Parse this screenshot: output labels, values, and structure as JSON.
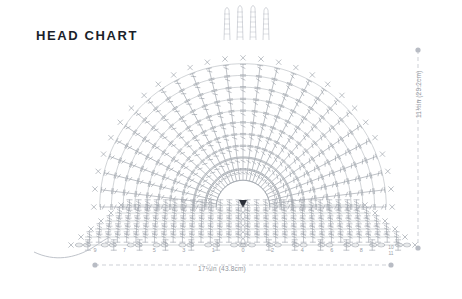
{
  "page": {
    "title": "HEAD CHART",
    "background_color": "#ffffff",
    "title_color": "#1b1f2a"
  },
  "dimensions": {
    "width_label": "17¼in (43.8cm)",
    "height_label": "11½in (29.2cm)",
    "guide_color": "#b8bcc4"
  },
  "chart": {
    "type": "crochet-stitch-diagram",
    "shape": "semicircular-fan",
    "stitch_color": "#9aa0a8",
    "center": {
      "x": 243,
      "y": 207
    },
    "radius": 155,
    "stitch_symbols": [
      {
        "name": "single-crochet",
        "glyph": "X",
        "used_on": "outer-edge-and-row-ends"
      },
      {
        "name": "double-crochet",
        "glyph": "vertical-bar-with-slash",
        "used_on": "radial-fan"
      },
      {
        "name": "treble-crochet",
        "glyph": "vertical-bar-with-double-slash",
        "used_on": "horizontal-rows"
      },
      {
        "name": "chain-stitch",
        "glyph": "oval",
        "used_on": "foundation-row"
      }
    ],
    "radial_spokes": 26,
    "arc_rows": 11,
    "flat_rows": 5,
    "fringe_strands": 4,
    "yarn_tail": "curved-line-left"
  },
  "axis": {
    "label": "stitch-count-ruler",
    "left_ticks": [
      "9",
      "7",
      "5",
      "3",
      "1"
    ],
    "center_tick": "0",
    "right_ticks": [
      "2",
      "4",
      "6",
      "8"
    ],
    "end_tick_stacked": [
      "10",
      "11"
    ],
    "tick_color": "#9aa0a8"
  }
}
